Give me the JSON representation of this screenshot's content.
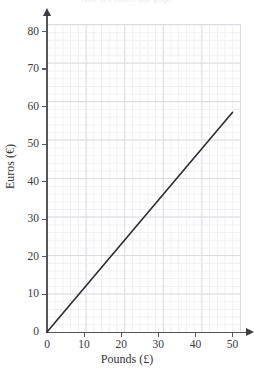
{
  "header": {
    "clipped_text": "Here is a conversion graph"
  },
  "chart_data": {
    "type": "line",
    "title": "",
    "xlabel": "Pounds (£)",
    "ylabel": "Euros (€)",
    "xlim": [
      0,
      52
    ],
    "ylim": [
      0,
      82
    ],
    "xticks": [
      0,
      10,
      20,
      30,
      40,
      50
    ],
    "xticklabels": [
      "0",
      "10",
      "20",
      "30",
      "40",
      "50"
    ],
    "yticks": [
      0,
      10,
      20,
      30,
      40,
      50,
      60,
      70,
      80
    ],
    "yticklabels": [
      "0",
      "10",
      "20",
      "30",
      "40",
      "50",
      "60",
      "70",
      "80"
    ],
    "grid": true,
    "grid_major_step": 10,
    "grid_minor_step": 2,
    "legend": false,
    "series": [
      {
        "name": "Pounds to Euros conversion",
        "color": "#2b2b31",
        "x": [
          0,
          50
        ],
        "y": [
          0,
          58.5
        ],
        "slope": 1.17,
        "intercept": 0
      }
    ]
  },
  "axis_colors": {
    "axis": "#55555c",
    "grid_major": "#dcdbe2",
    "grid_minor": "#f0eff3",
    "line": "#2b2b31",
    "text": "#3a3a40",
    "background": "#ffffff"
  }
}
